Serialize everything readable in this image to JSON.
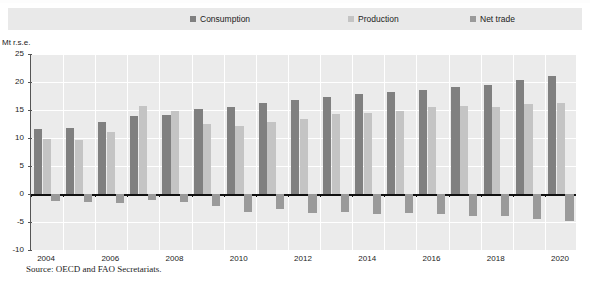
{
  "legend": {
    "items": [
      {
        "label": "Consumption",
        "color": "#808080",
        "key": "consumption"
      },
      {
        "label": "Production",
        "color": "#c4c4c4",
        "key": "production"
      },
      {
        "label": "Net trade",
        "color": "#9a9a9a",
        "key": "net_trade"
      }
    ]
  },
  "axis": {
    "y_unit": "Mt r.s.e.",
    "y_ticks": [
      "25",
      "20",
      "15",
      "10",
      "5",
      "0",
      "-5",
      "-10"
    ],
    "x_ticks": [
      "2004",
      "2006",
      "2008",
      "2010",
      "2012",
      "2014",
      "2016",
      "2018",
      "2020"
    ]
  },
  "source": {
    "text": "Source:  OECD and FAO Secretariats."
  },
  "chart_data": {
    "type": "bar",
    "title": "",
    "xlabel": "",
    "ylabel": "Mt r.s.e.",
    "ylim": [
      -10,
      25
    ],
    "ytick_step": 5,
    "grid": true,
    "legend_position": "top",
    "categories": [
      "2004",
      "2005",
      "2006",
      "2007",
      "2008",
      "2009",
      "2010",
      "2011",
      "2012",
      "2013",
      "2014",
      "2015",
      "2016",
      "2017",
      "2018",
      "2019",
      "2020"
    ],
    "series": [
      {
        "name": "Consumption",
        "color": "#808080",
        "values": [
          11.6,
          11.8,
          12.8,
          13.9,
          14.1,
          15.1,
          15.6,
          16.3,
          16.7,
          17.3,
          17.8,
          18.2,
          18.5,
          19.1,
          19.4,
          20.4,
          21.0
        ]
      },
      {
        "name": "Production",
        "color": "#c4c4c4",
        "values": [
          9.9,
          9.6,
          11.0,
          15.8,
          14.8,
          12.5,
          12.2,
          12.9,
          13.4,
          14.2,
          14.4,
          14.8,
          15.5,
          15.8,
          15.6,
          16.1,
          16.2
        ]
      },
      {
        "name": "Net trade",
        "color": "#9a9a9a",
        "values": [
          -1.2,
          -1.5,
          -1.6,
          -1.1,
          -1.4,
          -2.1,
          -3.3,
          -2.7,
          -3.4,
          -3.3,
          -3.5,
          -3.4,
          -3.6,
          -3.9,
          -4.0,
          -4.4,
          -4.8
        ]
      }
    ]
  }
}
